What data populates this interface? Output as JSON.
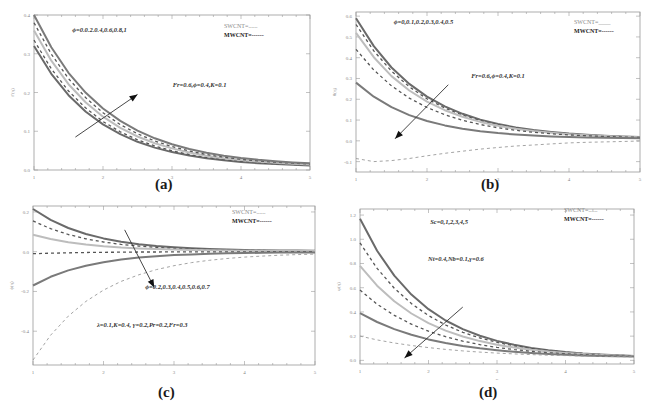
{
  "figure": {
    "captions": [
      "(a)",
      "(b)",
      "(c)",
      "(d)"
    ]
  },
  "chart_data": [
    {
      "id": "a",
      "type": "line",
      "caption": "(a)",
      "title": "",
      "xlabel": "η",
      "ylabel": "f′(η)",
      "xlim": [
        1,
        5
      ],
      "ylim": [
        0.0,
        0.4
      ],
      "xticks": [
        "1",
        "2",
        "3",
        "4",
        "5"
      ],
      "yticks": [
        "0.0",
        "0.1",
        "0.2",
        "0.3",
        "0.4"
      ],
      "ytick_values": [
        0.0,
        0.1,
        0.2,
        0.3,
        0.4
      ],
      "grid": false,
      "legend": {
        "position": "top-right",
        "entries": [
          {
            "label": "SWCNT=......",
            "style": "solid"
          },
          {
            "label": "MWCNT=------",
            "style": "dashed"
          }
        ]
      },
      "annotations": [
        {
          "text": "ϕ=0.0.2.0.4,0.6,0.8,1",
          "x": 1.95,
          "y": 0.355
        },
        {
          "text": "Fr=0.6,ϕ=0.4,K=0.1",
          "x": 3.4,
          "y": 0.215
        }
      ],
      "arrow": {
        "from": [
          1.6,
          0.085
        ],
        "to": [
          2.5,
          0.195
        ],
        "direction": "increasing"
      },
      "x": [
        1,
        1.25,
        1.5,
        1.75,
        2,
        2.25,
        2.5,
        2.75,
        3,
        3.25,
        3.5,
        3.75,
        4,
        4.25,
        4.5,
        4.75,
        5
      ],
      "series": [
        {
          "name": "curve-1",
          "style": "solid",
          "color": "#6a6a6a",
          "start": 0.32,
          "decay": 1.04,
          "end": 0.007
        },
        {
          "name": "curve-2",
          "style": "dashed",
          "color": "#555555",
          "start": 0.335,
          "decay": 1.02,
          "end": 0.007
        },
        {
          "name": "curve-3",
          "style": "solid",
          "color": "#bdbdbd",
          "start": 0.36,
          "decay": 1.0,
          "end": 0.008
        },
        {
          "name": "curve-4",
          "style": "dashed",
          "color": "#555555",
          "start": 0.38,
          "decay": 0.98,
          "end": 0.008
        },
        {
          "name": "curve-5",
          "style": "solid",
          "color": "#7a7a7a",
          "start": 0.4,
          "decay": 0.96,
          "end": 0.009
        }
      ]
    },
    {
      "id": "b",
      "type": "line",
      "caption": "(b)",
      "title": "",
      "xlabel": "η",
      "ylabel": "θ(η)",
      "xlim": [
        1,
        5
      ],
      "ylim": [
        -0.15,
        0.62
      ],
      "xticks": [
        "1",
        "2",
        "3",
        "4",
        "5"
      ],
      "yticks": [
        "-0.1",
        "0.0",
        "0.1",
        "0.2",
        "0.3",
        "0.4",
        "0.5",
        "0.6"
      ],
      "ytick_values": [
        -0.1,
        0.0,
        0.1,
        0.2,
        0.3,
        0.4,
        0.5,
        0.6
      ],
      "grid": false,
      "legend": {
        "position": "top-right",
        "entries": [
          {
            "label": "SWCNT=____",
            "style": "solid"
          },
          {
            "label": "MWCNT=------",
            "style": "dashed"
          }
        ]
      },
      "annotations": [
        {
          "text": "ϕ=0,0.1,0.2,0.3,0.4,0.5",
          "x": 1.95,
          "y": 0.56
        },
        {
          "text": "Fr=0.6,ϕ=0.4,K=0.1",
          "x": 3.0,
          "y": 0.3
        }
      ],
      "arrow": {
        "from": [
          2.3,
          0.27
        ],
        "to": [
          1.55,
          0.01
        ],
        "direction": "decreasing"
      },
      "x": [
        1,
        1.25,
        1.5,
        1.75,
        2,
        2.25,
        2.5,
        2.75,
        3,
        3.25,
        3.5,
        3.75,
        4,
        4.25,
        4.5,
        4.75,
        5
      ],
      "series": [
        {
          "name": "curve-1",
          "style": "solid",
          "color": "#6a6a6a",
          "start": 0.59,
          "decay": 1.05,
          "end": 0.01
        },
        {
          "name": "curve-2",
          "style": "dashed",
          "color": "#555555",
          "start": 0.56,
          "decay": 1.05,
          "end": 0.01
        },
        {
          "name": "curve-3",
          "style": "solid",
          "color": "#bdbdbd",
          "start": 0.52,
          "decay": 1.05,
          "end": 0.01
        },
        {
          "name": "curve-4",
          "style": "dashed",
          "color": "#555555",
          "start": 0.44,
          "decay": 1.05,
          "end": 0.01
        },
        {
          "name": "curve-5",
          "style": "solid",
          "color": "#7a7a7a",
          "start": 0.28,
          "decay": 1.15,
          "end": 0.01
        },
        {
          "name": "curve-6",
          "style": "dashed-light",
          "color": "#9a9a9a",
          "points": [
            -0.085,
            -0.1,
            -0.095,
            -0.085,
            -0.072,
            -0.06,
            -0.05,
            -0.04,
            -0.032,
            -0.025,
            -0.02,
            -0.015,
            -0.01,
            -0.007,
            -0.005,
            -0.003,
            -0.001
          ]
        }
      ]
    },
    {
      "id": "c",
      "type": "line",
      "caption": "(c)",
      "title": "",
      "xlabel": "η",
      "ylabel": "ϕ(η)",
      "xlim": [
        1,
        5
      ],
      "ylim": [
        -0.57,
        0.23
      ],
      "xticks": [
        "1",
        "2",
        "3",
        "4",
        "5"
      ],
      "yticks": [
        "-0.4",
        "-0.2",
        "0.0",
        "0.2"
      ],
      "ytick_values": [
        -0.4,
        -0.2,
        0.0,
        0.2
      ],
      "grid": false,
      "legend": {
        "position": "top-right",
        "entries": [
          {
            "label": "SWCNT=......",
            "style": "solid"
          },
          {
            "label": "MWCNT=------",
            "style": "dashed"
          }
        ]
      },
      "annotations": [
        {
          "text": "ϕ=0.2,0.3,0.4,0.5,0.6,0.7",
          "x": 3.05,
          "y": -0.19
        },
        {
          "text": "λ=0.1,K=0.4, γ=0.2,Pr=0.2,Fr=0.3",
          "x": 2.55,
          "y": -0.38
        }
      ],
      "arrow": {
        "from": [
          2.3,
          0.11
        ],
        "to": [
          2.72,
          -0.18
        ],
        "direction": "decreasing"
      },
      "x": [
        1,
        1.25,
        1.5,
        1.75,
        2,
        2.25,
        2.5,
        2.75,
        3,
        3.25,
        3.5,
        3.75,
        4,
        4.25,
        4.5,
        4.75,
        5
      ],
      "series": [
        {
          "name": "curve-1",
          "style": "solid",
          "color": "#6a6a6a",
          "start": 0.215,
          "decay": 1.2,
          "end": 0.003
        },
        {
          "name": "curve-2",
          "style": "dashed",
          "color": "#555555",
          "start": 0.155,
          "decay": 1.2,
          "end": 0.003
        },
        {
          "name": "curve-3",
          "style": "solid",
          "color": "#bdbdbd",
          "start": 0.085,
          "decay": 1.2,
          "end": 0.003
        },
        {
          "name": "curve-4",
          "style": "dashed",
          "color": "#555555",
          "start": -0.01,
          "decay": 1.2,
          "end": 0.0
        },
        {
          "name": "curve-5",
          "style": "solid",
          "color": "#7a7a7a",
          "start": -0.17,
          "decay": 1.2,
          "end": -0.002
        },
        {
          "name": "curve-6",
          "style": "dashed-light",
          "color": "#9a9a9a",
          "start": -0.545,
          "decay": 1.05,
          "end": -0.004
        }
      ]
    },
    {
      "id": "d",
      "type": "line",
      "caption": "(d)",
      "title": "",
      "xlabel": "η",
      "ylabel": "φ(η)",
      "xlim": [
        1,
        5
      ],
      "ylim": [
        -0.03,
        1.25
      ],
      "xticks": [
        "1",
        "2",
        "3",
        "4",
        "5"
      ],
      "yticks": [
        "0.0",
        "0.2",
        "0.4",
        "0.6",
        "0.8",
        "1.0",
        "1.2"
      ],
      "ytick_values": [
        0.0,
        0.2,
        0.4,
        0.6,
        0.8,
        1.0,
        1.2
      ],
      "grid": false,
      "legend": {
        "position": "top-right",
        "entries": [
          {
            "label": "SWCNT=......",
            "style": "solid"
          },
          {
            "label": "MWCNT=------",
            "style": "dashed"
          }
        ]
      },
      "annotations": [
        {
          "text": "Sc=0,1,2,3,4,5",
          "x": 2.3,
          "y": 1.13
        },
        {
          "text": "Nt=0.4,Nb=0.1,γ=0.6",
          "x": 2.4,
          "y": 0.82
        }
      ],
      "arrow": {
        "from": [
          2.5,
          0.44
        ],
        "to": [
          1.65,
          0.02
        ],
        "direction": "decreasing"
      },
      "x": [
        1,
        1.25,
        1.5,
        1.75,
        2,
        2.25,
        2.5,
        2.75,
        3,
        3.25,
        3.5,
        3.75,
        4,
        4.25,
        4.5,
        4.75,
        5
      ],
      "series": [
        {
          "name": "curve-1",
          "style": "solid",
          "color": "#6a6a6a",
          "start": 1.17,
          "decay": 1.05,
          "end": 0.02
        },
        {
          "name": "curve-2",
          "style": "dashed",
          "color": "#555555",
          "start": 0.97,
          "decay": 1.0,
          "end": 0.02
        },
        {
          "name": "curve-3",
          "style": "solid",
          "color": "#bdbdbd",
          "start": 0.78,
          "decay": 0.97,
          "end": 0.02
        },
        {
          "name": "curve-4",
          "style": "dashed",
          "color": "#555555",
          "start": 0.58,
          "decay": 0.93,
          "end": 0.02
        },
        {
          "name": "curve-5",
          "style": "solid",
          "color": "#7a7a7a",
          "start": 0.39,
          "decay": 0.88,
          "end": 0.02
        },
        {
          "name": "curve-6",
          "style": "dashed-light",
          "color": "#9a9a9a",
          "start": 0.2,
          "decay": 0.75,
          "end": 0.02
        }
      ]
    }
  ]
}
